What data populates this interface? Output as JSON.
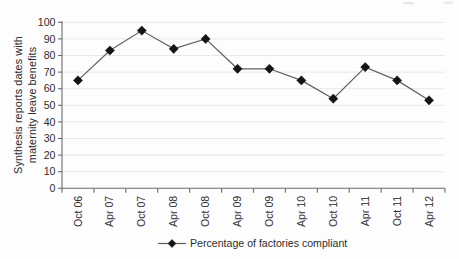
{
  "chart_data": {
    "type": "line",
    "title": "",
    "ylabel_lines": [
      "Synthesis reports dates with",
      "maternity leave benefits"
    ],
    "xlabel": "",
    "categories": [
      "Oct 06",
      "Apr 07",
      "Oct 07",
      "Apr 08",
      "Oct 08",
      "Apr 09",
      "Oct 09",
      "Apr 10",
      "Oct 10",
      "Apr 11",
      "Oct 11",
      "Apr 12"
    ],
    "series": [
      {
        "name": "Percentage of factories compliant",
        "marker": "diamond",
        "values": [
          65,
          83,
          95,
          84,
          90,
          72,
          72,
          65,
          54,
          73,
          65,
          53
        ]
      }
    ],
    "ylim": [
      0,
      100
    ],
    "ytick_step": 10,
    "grid": "horizontal",
    "legend_position": "bottom-center",
    "colors": {
      "line": "#5f5f5f",
      "marker": "#141414",
      "axis": "#6b6b6b",
      "gridline": "#e8e8e8",
      "text": "#2d2d2d",
      "background": "#fdfdfd"
    }
  }
}
